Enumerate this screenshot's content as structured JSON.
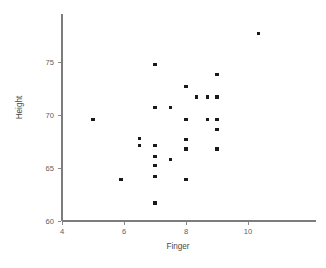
{
  "chart_data": {
    "type": "scatter",
    "title": "",
    "xlabel": "Finger",
    "ylabel": "Height",
    "xlim": [
      4,
      11.6
    ],
    "ylim": [
      60,
      78.9
    ],
    "xticks": [
      4,
      6,
      8,
      10
    ],
    "xtick_labels": [
      "4",
      "6",
      "8",
      "10"
    ],
    "yticks": [
      60,
      65,
      70,
      75
    ],
    "ytick_labels": [
      "60",
      "65",
      "70",
      "75"
    ],
    "grid": false,
    "legend": null,
    "marker": "square",
    "marker_color": "#1a1a1a",
    "points": [
      {
        "x": 5.0,
        "y": 69.6
      },
      {
        "x": 5.9,
        "y": 63.9
      },
      {
        "x": 6.5,
        "y": 67.8
      },
      {
        "x": 6.5,
        "y": 67.1
      },
      {
        "x": 7.0,
        "y": 74.8
      },
      {
        "x": 7.0,
        "y": 70.7
      },
      {
        "x": 7.0,
        "y": 67.1
      },
      {
        "x": 7.0,
        "y": 66.1
      },
      {
        "x": 7.0,
        "y": 65.2
      },
      {
        "x": 7.0,
        "y": 64.2
      },
      {
        "x": 7.0,
        "y": 61.7
      },
      {
        "x": 7.5,
        "y": 70.7
      },
      {
        "x": 7.5,
        "y": 65.8
      },
      {
        "x": 8.0,
        "y": 72.7
      },
      {
        "x": 8.0,
        "y": 69.6
      },
      {
        "x": 8.0,
        "y": 67.7
      },
      {
        "x": 8.0,
        "y": 66.8
      },
      {
        "x": 8.0,
        "y": 63.9
      },
      {
        "x": 8.35,
        "y": 71.7
      },
      {
        "x": 8.7,
        "y": 71.7
      },
      {
        "x": 8.7,
        "y": 69.6
      },
      {
        "x": 9.0,
        "y": 73.8
      },
      {
        "x": 9.0,
        "y": 71.7
      },
      {
        "x": 9.0,
        "y": 69.6
      },
      {
        "x": 9.0,
        "y": 68.6
      },
      {
        "x": 9.0,
        "y": 66.8
      },
      {
        "x": 10.35,
        "y": 77.7
      }
    ]
  },
  "axes": {
    "x_title": "Finger",
    "y_title": "Height"
  }
}
